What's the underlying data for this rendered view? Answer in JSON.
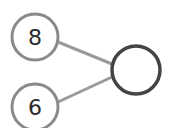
{
  "diagram": {
    "type": "number-bond",
    "parts": [
      {
        "label": "8",
        "cx": 35,
        "cy": 37,
        "r": 23
      },
      {
        "label": "6",
        "cx": 35,
        "cy": 107,
        "r": 23
      }
    ],
    "whole": {
      "label": "",
      "cx": 136,
      "cy": 70,
      "r": 24
    },
    "colors": {
      "part_stroke": "#8a8a8a",
      "whole_stroke": "#444444",
      "line": "#9a9a9a",
      "text": "#2a2a2a"
    }
  }
}
